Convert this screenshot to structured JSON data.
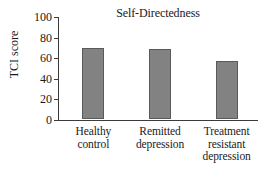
{
  "chart_data": {
    "type": "bar",
    "title": "Self-Directedness",
    "xlabel": "",
    "ylabel": "TCI score",
    "categories": [
      "Healthy control",
      "Remitted depression",
      "Treatment resistant depression"
    ],
    "category_lines": [
      [
        "Healthy",
        "control"
      ],
      [
        "Remitted",
        "depression"
      ],
      [
        "Treatment",
        "resistant",
        "depression"
      ]
    ],
    "values": [
      69,
      68,
      56
    ],
    "ylim": [
      0,
      100
    ],
    "yticks": [
      100,
      80,
      60,
      40,
      20,
      0
    ],
    "ytick_labels": [
      "100",
      "80",
      "60",
      "40",
      "20",
      "0"
    ],
    "grid": false,
    "legend": null,
    "bar_color": "#828282",
    "bar_edge_color": "#5a5a5a",
    "axis_color": "#3b3b3b"
  }
}
